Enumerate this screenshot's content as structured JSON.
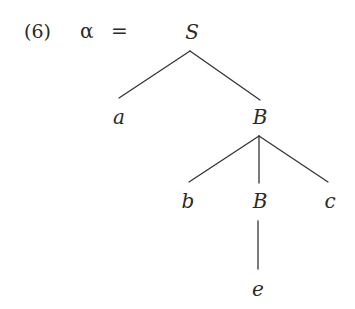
{
  "example": {
    "number": "(6)",
    "lhs": "α",
    "equals": "="
  },
  "tree": {
    "root": {
      "label": "S",
      "children": [
        {
          "label": "a",
          "children": []
        },
        {
          "label": "B",
          "children": [
            {
              "label": "b",
              "children": []
            },
            {
              "label": "B",
              "children": [
                {
                  "label": "e",
                  "children": []
                }
              ]
            },
            {
              "label": "c",
              "children": []
            }
          ]
        }
      ]
    }
  },
  "colors": {
    "text": "#2a2a2a",
    "edges": "#333333",
    "background": "#ffffff"
  }
}
